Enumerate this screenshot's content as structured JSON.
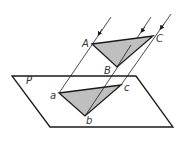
{
  "diagram": {
    "labels": {
      "plane": "P",
      "A": "A",
      "B": "B",
      "C": "C",
      "a": "a",
      "b": "b",
      "c": "c"
    },
    "colors": {
      "stroke": "#1a1a1a",
      "fill": "#bfbfbf",
      "label": "#333333"
    }
  }
}
